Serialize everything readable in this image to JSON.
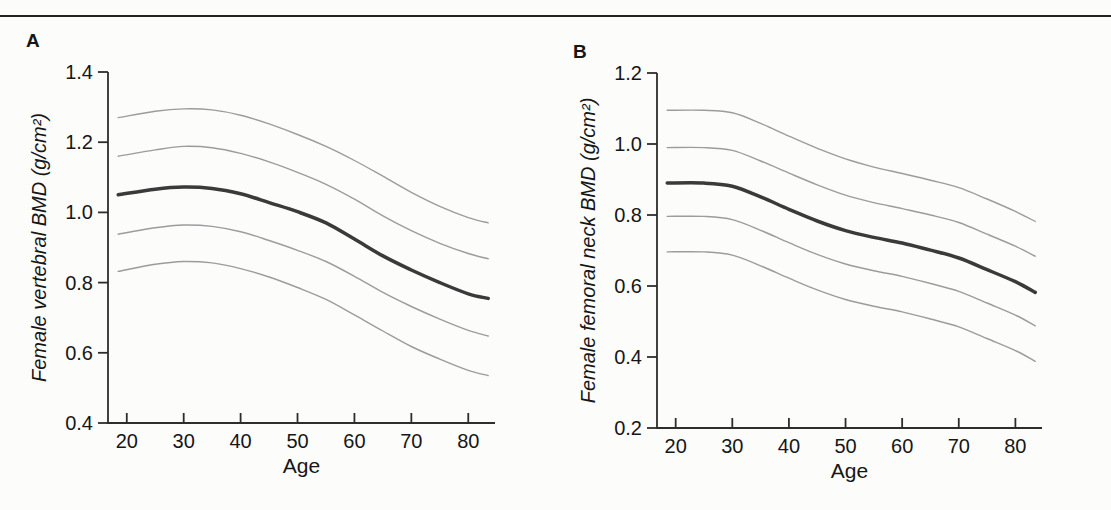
{
  "figure": {
    "panel_a_label": "A",
    "panel_b_label": "B",
    "colors": {
      "background": "#fcfcfb",
      "top_rule": "#222220",
      "axis": "#2d2d2d",
      "text": "#161616",
      "mean_line": "#3a3a3a",
      "band_line": "#9c9c9c"
    }
  },
  "chart_data": [
    {
      "id": "A",
      "type": "line",
      "panel_label": "A",
      "xlabel": "Age",
      "ylabel": "Female vertebral BMD (g/cm²)",
      "xlim": [
        16.7,
        84.7
      ],
      "ylim": [
        0.4,
        1.4
      ],
      "x_ticks": [
        20,
        30,
        40,
        50,
        60,
        70,
        80
      ],
      "y_ticks": [
        0.4,
        0.6,
        0.8,
        1.0,
        1.2,
        1.4
      ],
      "grid": false,
      "legend": "none",
      "x": [
        18.5,
        25,
        30,
        35,
        40,
        45,
        50,
        55,
        60,
        65,
        70,
        75,
        80,
        83.5
      ],
      "series": [
        {
          "name": "upper-band-2",
          "role": "band",
          "values": [
            1.27,
            1.288,
            1.295,
            1.292,
            1.277,
            1.252,
            1.222,
            1.188,
            1.148,
            1.103,
            1.057,
            1.017,
            0.985,
            0.97
          ]
        },
        {
          "name": "upper-band-1",
          "role": "band",
          "values": [
            1.16,
            1.178,
            1.188,
            1.184,
            1.168,
            1.144,
            1.114,
            1.08,
            1.038,
            0.99,
            0.948,
            0.912,
            0.883,
            0.868
          ]
        },
        {
          "name": "mean",
          "role": "mean",
          "values": [
            1.05,
            1.066,
            1.072,
            1.068,
            1.053,
            1.028,
            1.002,
            0.97,
            0.924,
            0.876,
            0.836,
            0.8,
            0.768,
            0.755
          ]
        },
        {
          "name": "lower-band-1",
          "role": "band",
          "values": [
            0.938,
            0.956,
            0.964,
            0.96,
            0.945,
            0.92,
            0.892,
            0.86,
            0.818,
            0.772,
            0.732,
            0.696,
            0.664,
            0.648
          ]
        },
        {
          "name": "lower-band-2",
          "role": "band",
          "values": [
            0.832,
            0.852,
            0.86,
            0.856,
            0.84,
            0.816,
            0.786,
            0.752,
            0.708,
            0.662,
            0.618,
            0.582,
            0.55,
            0.535
          ]
        }
      ]
    },
    {
      "id": "B",
      "type": "line",
      "panel_label": "B",
      "xlabel": "Age",
      "ylabel": "Female femoral neck BMD (g/cm²)",
      "xlim": [
        16.7,
        84.7
      ],
      "ylim": [
        0.2,
        1.2
      ],
      "x_ticks": [
        20,
        30,
        40,
        50,
        60,
        70,
        80
      ],
      "y_ticks": [
        0.2,
        0.4,
        0.6,
        0.8,
        1.0,
        1.2
      ],
      "grid": false,
      "legend": "none",
      "x": [
        18.5,
        25,
        30,
        35,
        40,
        45,
        50,
        55,
        60,
        65,
        70,
        75,
        80,
        83.5
      ],
      "series": [
        {
          "name": "upper-band-2",
          "role": "band",
          "values": [
            1.095,
            1.095,
            1.088,
            1.058,
            1.022,
            0.988,
            0.958,
            0.935,
            0.917,
            0.898,
            0.877,
            0.845,
            0.81,
            0.782
          ]
        },
        {
          "name": "upper-band-1",
          "role": "band",
          "values": [
            0.99,
            0.99,
            0.982,
            0.952,
            0.918,
            0.885,
            0.856,
            0.835,
            0.818,
            0.8,
            0.779,
            0.746,
            0.712,
            0.684
          ]
        },
        {
          "name": "mean",
          "role": "mean",
          "values": [
            0.89,
            0.89,
            0.881,
            0.851,
            0.816,
            0.783,
            0.756,
            0.737,
            0.721,
            0.701,
            0.679,
            0.646,
            0.612,
            0.582
          ]
        },
        {
          "name": "lower-band-1",
          "role": "band",
          "values": [
            0.796,
            0.796,
            0.787,
            0.757,
            0.722,
            0.689,
            0.662,
            0.643,
            0.627,
            0.607,
            0.585,
            0.552,
            0.518,
            0.488
          ]
        },
        {
          "name": "lower-band-2",
          "role": "band",
          "values": [
            0.696,
            0.696,
            0.687,
            0.657,
            0.622,
            0.589,
            0.562,
            0.543,
            0.527,
            0.507,
            0.485,
            0.452,
            0.418,
            0.388
          ]
        }
      ]
    }
  ]
}
